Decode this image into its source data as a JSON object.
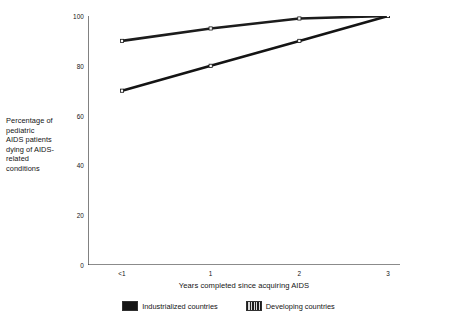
{
  "chart_data": {
    "type": "line",
    "title": "",
    "subtitle": "",
    "xlabel": "Years completed since acquiring AIDS",
    "ylabel": "Percentage of pediatric AIDS patients dying of AIDS-related conditions",
    "categories": [
      "<1",
      "1",
      "2",
      "3"
    ],
    "series": [
      {
        "name": "Industrialized countries",
        "values": [
          70,
          80,
          90,
          100
        ],
        "marker": "square",
        "swatch": "solid",
        "color": "#141414"
      },
      {
        "name": "Developing countries",
        "values": [
          90,
          95,
          99,
          100
        ],
        "marker": "square",
        "swatch": "hatched",
        "color": "#1c1c1c"
      }
    ],
    "ylim": [
      0,
      100
    ],
    "y_ticks": [
      0,
      20,
      40,
      60,
      80,
      100
    ],
    "y_tick_labels": [
      "0",
      "20",
      "40",
      "60",
      "80",
      "100"
    ],
    "x_tick_labels": [
      "<1",
      "1",
      "2",
      "3"
    ],
    "grid": false,
    "legend_position": "bottom"
  },
  "axis": {
    "y_label_lines": [
      "Percentage of",
      "pediatric",
      "AIDS patients",
      "dying of AIDS-",
      "related",
      "conditions"
    ],
    "x_title": "Years completed since acquiring AIDS"
  },
  "legend": {
    "items": [
      {
        "label": "Industrialized countries",
        "style": "solid"
      },
      {
        "label": "Developing countries",
        "style": "hatched"
      }
    ]
  }
}
